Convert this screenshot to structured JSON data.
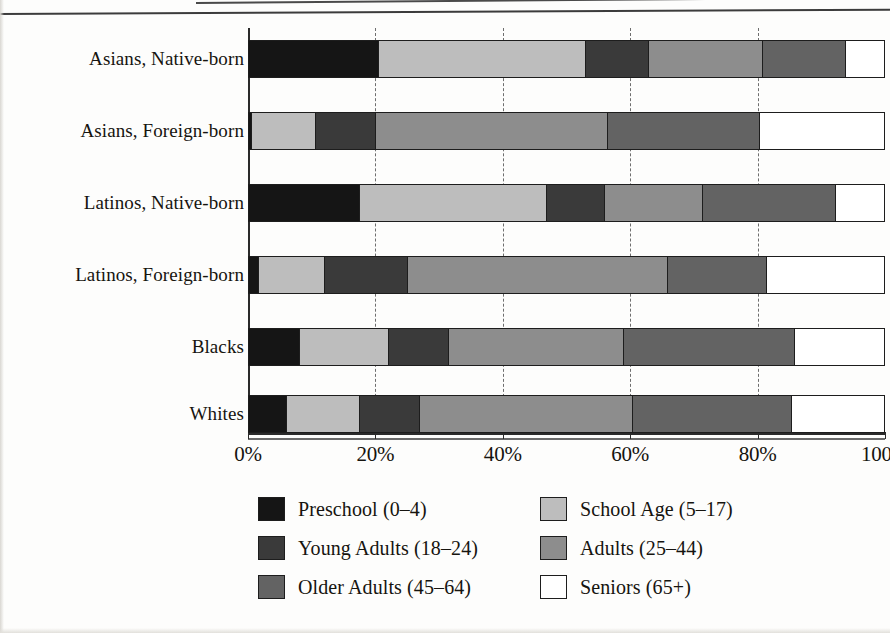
{
  "chart_data": {
    "type": "bar",
    "orientation": "horizontal",
    "stacked": true,
    "stacked_percent": true,
    "title": "",
    "subtitle": "",
    "xlabel": "",
    "ylabel": "",
    "xlim": [
      0,
      100
    ],
    "xtick_labels": [
      "0%",
      "20%",
      "40%",
      "60%",
      "80%",
      "100%"
    ],
    "xticks": [
      0,
      20,
      40,
      60,
      80,
      100
    ],
    "grid": "vertical-dashed",
    "legend_position": "bottom",
    "categories": [
      "Asians, Native-born",
      "Asians, Foreign-born",
      "Latinos, Native-born",
      "Latinos, Foreign-born",
      "Blacks",
      "Whites"
    ],
    "series": [
      {
        "name": "Preschool (0–4)",
        "color": "#151515",
        "values": [
          20.5,
          0.5,
          17.5,
          1.5,
          8.0,
          6.0
        ]
      },
      {
        "name": "School Age (5–17)",
        "color": "#bdbdbd",
        "values": [
          32.5,
          10.0,
          29.5,
          10.5,
          14.0,
          11.5
        ]
      },
      {
        "name": "Young Adults (18–24)",
        "color": "#3a3a3a",
        "values": [
          10.0,
          9.5,
          9.0,
          13.0,
          9.5,
          9.5
        ]
      },
      {
        "name": "Adults (25–44)",
        "color": "#8d8d8d",
        "values": [
          18.0,
          36.5,
          15.5,
          41.0,
          27.5,
          33.5
        ]
      },
      {
        "name": "Older Adults (45–64)",
        "color": "#636363",
        "values": [
          13.0,
          24.0,
          21.0,
          15.5,
          27.0,
          25.0
        ]
      },
      {
        "name": "Seniors (65+)",
        "color": "#ffffff",
        "values": [
          6.0,
          19.5,
          7.5,
          18.5,
          14.0,
          14.5
        ]
      }
    ]
  },
  "legend": {
    "items": [
      {
        "label": "Preschool (0–4)",
        "color": "#151515"
      },
      {
        "label": "School Age (5–17)",
        "color": "#bdbdbd"
      },
      {
        "label": "Young Adults (18–24)",
        "color": "#3a3a3a"
      },
      {
        "label": "Adults (25–44)",
        "color": "#8d8d8d"
      },
      {
        "label": "Older Adults (45–64)",
        "color": "#636363"
      },
      {
        "label": "Seniors (65+)",
        "color": "#ffffff"
      }
    ]
  }
}
